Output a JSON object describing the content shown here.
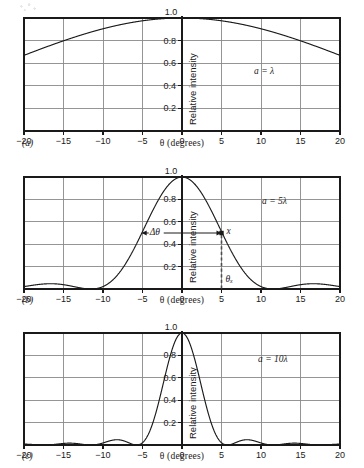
{
  "figure": {
    "caption_tags": [
      "(a)",
      "(b)",
      "(c)"
    ],
    "axis": {
      "xlabel": "θ (degrees)",
      "ylabel": "Relative intensity",
      "xticks": [
        "−20",
        "−15",
        "−10",
        "−5",
        "0",
        "5",
        "10",
        "15",
        "20"
      ],
      "xtick_values": [
        -20,
        -15,
        -10,
        -5,
        0,
        5,
        10,
        15,
        20
      ],
      "yticks": [
        "0.2",
        "0.4",
        "0.6",
        "0.8",
        "1.0"
      ],
      "ytick_values": [
        0.2,
        0.4,
        0.6,
        0.8,
        1.0
      ]
    },
    "colors": {
      "curve": "#1a1a1a",
      "frame": "#1a1a1a",
      "grid": "#8a8a8a",
      "axis_zero": "#1a1a1a",
      "marker": "#1a1a1a",
      "dashed": "#4d4d4d",
      "background": "#ffffff"
    },
    "annotations": {
      "panel_a_label": "a = λ",
      "panel_b_label": "a = 5λ",
      "panel_c_label": "a = 10λ",
      "delta_theta": "Δθ",
      "point_x": "x",
      "theta_x": "θₓ"
    }
  },
  "chart_data": [
    {
      "type": "line",
      "panel": "(a)",
      "title": "a = λ",
      "xlabel": "θ (degrees)",
      "ylabel": "Relative intensity",
      "xlim": [
        -20,
        20
      ],
      "ylim": [
        0,
        1.0
      ],
      "grid": true,
      "legend": "none",
      "aperture_ratio_a_over_lambda": 1,
      "function": "I/Im = (sin(alpha)/alpha)^2, alpha = (pi*a/lambda)*sin(theta)",
      "x": [
        -20,
        -17.5,
        -15,
        -12.5,
        -10,
        -7.5,
        -5,
        -2.5,
        0,
        2.5,
        5,
        7.5,
        10,
        12.5,
        15,
        17.5,
        20
      ],
      "y": [
        0.64,
        0.72,
        0.79,
        0.85,
        0.9,
        0.94,
        0.97,
        0.99,
        1.0,
        0.99,
        0.97,
        0.94,
        0.9,
        0.85,
        0.79,
        0.72,
        0.64
      ]
    },
    {
      "type": "line",
      "panel": "(b)",
      "title": "a = 5λ",
      "xlabel": "θ (degrees)",
      "ylabel": "Relative intensity",
      "xlim": [
        -20,
        20
      ],
      "ylim": [
        0,
        1.0
      ],
      "grid": true,
      "legend": "none",
      "aperture_ratio_a_over_lambda": 5,
      "function": "I/Im = (sin(alpha)/alpha)^2, alpha = (pi*a/lambda)*sin(theta)",
      "first_minimum_deg": 11.5,
      "half_width_delta_theta_deg": 5.1,
      "marked_point": {
        "label": "x",
        "theta_deg": 5,
        "intensity": 0.5
      },
      "x": [
        -20,
        -17.5,
        -15,
        -12.5,
        -11.5,
        -10,
        -7.5,
        -5,
        -2.5,
        0,
        2.5,
        5,
        7.5,
        10,
        11.5,
        12.5,
        15,
        17.5,
        20
      ],
      "y": [
        0.045,
        0.05,
        0.02,
        0.003,
        0.0,
        0.013,
        0.17,
        0.5,
        0.86,
        1.0,
        0.86,
        0.5,
        0.17,
        0.013,
        0.0,
        0.003,
        0.02,
        0.05,
        0.045
      ]
    },
    {
      "type": "line",
      "panel": "(c)",
      "title": "a = 10λ",
      "xlabel": "θ (degrees)",
      "ylabel": "Relative intensity",
      "xlim": [
        -20,
        20
      ],
      "ylim": [
        0,
        1.0
      ],
      "grid": true,
      "legend": "none",
      "aperture_ratio_a_over_lambda": 10,
      "function": "I/Im = (sin(alpha)/alpha)^2, alpha = (pi*a/lambda)*sin(theta)",
      "first_minimum_deg": 5.7,
      "x": [
        -20,
        -18.5,
        -17,
        -15,
        -13,
        -11.5,
        -10,
        -9,
        -8,
        -6.5,
        -5.7,
        -5,
        -2.5,
        0,
        2.5,
        5,
        5.7,
        6.5,
        8,
        9,
        10,
        11.5,
        13,
        15,
        17,
        18.5,
        20
      ],
      "y": [
        0.008,
        0.012,
        0.006,
        0.0,
        0.009,
        0.016,
        0.009,
        0.0,
        0.013,
        0.03,
        0.0,
        0.1,
        0.63,
        1.0,
        0.63,
        0.1,
        0.0,
        0.03,
        0.013,
        0.0,
        0.009,
        0.016,
        0.009,
        0.0,
        0.006,
        0.012,
        0.008
      ]
    }
  ]
}
